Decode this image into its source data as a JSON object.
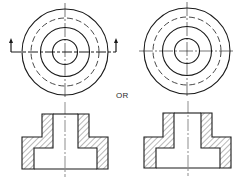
{
  "figure": {
    "separator_label": "OR",
    "colors": {
      "stroke": "#1a1a1a",
      "hatch": "#333333",
      "background": "#ffffff"
    },
    "views": [
      {
        "id": "top-view-left",
        "center": [
          65,
          52
        ],
        "radii": {
          "outer": 43,
          "hidden": 34,
          "middle": 24.5,
          "inner": 12.5
        },
        "cutting_plane": {
          "y": 52,
          "x_start": 11,
          "x_end": 116,
          "arrow_top": 38,
          "arrows": "up"
        }
      },
      {
        "id": "top-view-right",
        "center": [
          187,
          51
        ],
        "radii": {
          "outer": 43,
          "hidden": 34,
          "middle": 24.5,
          "inner": 12.5
        }
      }
    ],
    "sections": [
      {
        "id": "section-left",
        "centerline_x": 65,
        "boss": {
          "x1": 42,
          "x2": 89,
          "top": 114
        },
        "bore": {
          "x1": 53,
          "x2": 78
        },
        "shoulder_y": 137,
        "base": {
          "x1": 22,
          "x2": 108,
          "bottom": 169
        },
        "counterbore": {
          "x1": 34,
          "x2": 97,
          "top": 148
        }
      },
      {
        "id": "section-right",
        "centerline_x": 188,
        "boss": {
          "x1": 163,
          "x2": 212,
          "top": 113
        },
        "bore": {
          "x1": 174,
          "x2": 201
        },
        "shoulder_y": 137,
        "base": {
          "x1": 144,
          "x2": 231,
          "bottom": 168
        },
        "counterbore": {
          "x1": 156,
          "x2": 220,
          "top": 148
        }
      }
    ]
  }
}
